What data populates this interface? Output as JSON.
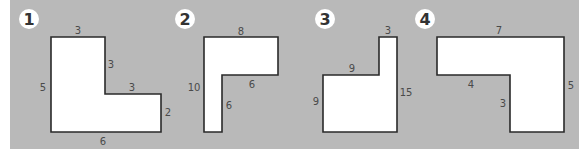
{
  "colors": {
    "background": "#b9b9b9",
    "shape_fill": "#ffffff",
    "shape_stroke": "#2a2a2a",
    "label_text": "#4a4a4a"
  },
  "figures": [
    {
      "badge": "1",
      "shape": "L-shape",
      "labels": {
        "top": "3",
        "inner_vertical": "3",
        "inner_horizontal": "3",
        "right": "2",
        "bottom": "6",
        "left": "5"
      }
    },
    {
      "badge": "2",
      "shape": "inverted L-shape",
      "labels": {
        "top": "8",
        "inner_horizontal": "6",
        "inner_vertical": "6",
        "left": "10"
      }
    },
    {
      "badge": "3",
      "shape": "L-shape with tall right column",
      "labels": {
        "top": "3",
        "inner_horizontal": "9",
        "left": "9",
        "right": "15"
      }
    },
    {
      "badge": "4",
      "shape": "inverted L-shape right",
      "labels": {
        "top": "7",
        "inner_horizontal": "4",
        "inner_vertical": "3",
        "right": "5"
      }
    }
  ]
}
